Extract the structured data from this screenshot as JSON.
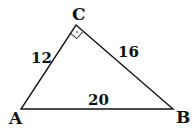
{
  "diagram": {
    "type": "right-triangle",
    "vertices": [
      {
        "label": "A",
        "x": 21,
        "y": 109
      },
      {
        "label": "B",
        "x": 173,
        "y": 109
      },
      {
        "label": "C",
        "x": 76,
        "y": 25
      }
    ],
    "sides": [
      {
        "between": "AC",
        "label": "12"
      },
      {
        "between": "CB",
        "label": "16"
      },
      {
        "between": "AB",
        "label": "20"
      }
    ],
    "right_angle_at": "C",
    "stroke_color": "#111111"
  }
}
